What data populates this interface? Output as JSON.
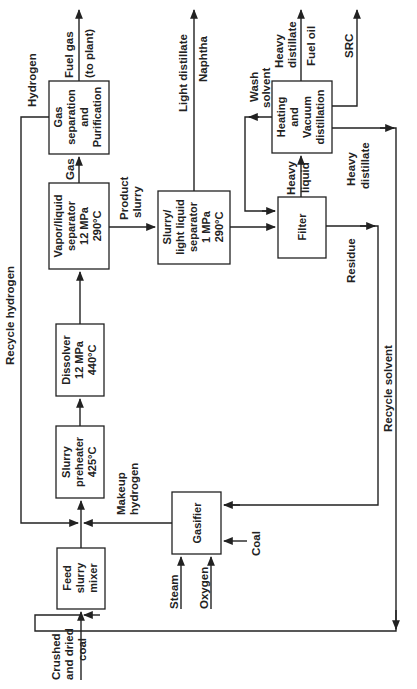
{
  "diagram": {
    "orientation": "rotated-90-ccw",
    "units": {
      "feed_mixer": {
        "lines": [
          "Feed",
          "slurry",
          "mixer"
        ]
      },
      "preheater": {
        "lines": [
          "Slurry",
          "preheater",
          "425°C"
        ]
      },
      "dissolver": {
        "lines": [
          "Dissolver",
          "12 MPa",
          "440°C"
        ]
      },
      "vl_separator": {
        "lines": [
          "Vapor/liquid",
          "separator",
          "12 MPa",
          "290°C"
        ]
      },
      "gas_sep": {
        "lines": [
          "Gas",
          "separation",
          "and",
          "Purification"
        ]
      },
      "sll_separator": {
        "lines": [
          "Slurry/",
          "light liquid",
          "separator",
          "1 MPa",
          "290°C"
        ]
      },
      "filter": {
        "lines": [
          "Filter"
        ]
      },
      "distillation": {
        "lines": [
          "Heating",
          "and",
          "Vacuum",
          "distillation"
        ]
      },
      "gasifier": {
        "lines": [
          "Gasifier"
        ]
      }
    },
    "streams": {
      "coal_feed": [
        "Crushed",
        "and dried",
        "coal"
      ],
      "makeup_h2": [
        "Makeup",
        "hydrogen"
      ],
      "recycle_h2": "Recycle hydrogen",
      "hydrogen": "Hydrogen",
      "gas": "Gas",
      "fuel_gas": [
        "Fuel gas",
        "(to plant)"
      ],
      "product_slurry": [
        "Product",
        "slurry"
      ],
      "light_distillate": "Light distillate",
      "naphtha": "Naphtha",
      "wash_solvent": [
        "Wash",
        "solvent"
      ],
      "heavy_liquid": [
        "Heavy",
        "liquid"
      ],
      "heavy_distillate_top": [
        "Heavy",
        "distillate"
      ],
      "fuel_oil": "Fuel oil",
      "src": "SRC",
      "heavy_distillate_side": [
        "Heavy",
        "distillate"
      ],
      "residue": "Residue",
      "recycle_solvent": "Recycle solvent",
      "steam": "Steam",
      "oxygen": "Oxygen",
      "coal_gasifier": "Coal"
    }
  }
}
